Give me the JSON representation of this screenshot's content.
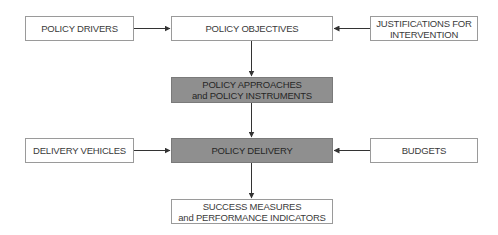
{
  "diagram": {
    "nodes": {
      "policy_drivers": {
        "label": "POLICY DRIVERS",
        "shaded": false
      },
      "policy_objectives": {
        "label": "POLICY OBJECTIVES",
        "shaded": false
      },
      "justifications": {
        "label": "JUSTIFICATIONS FOR\nINTERVENTION",
        "shaded": false
      },
      "policy_approaches": {
        "label": "POLICY APPROACHES\nand POLICY INSTRUMENTS",
        "shaded": true
      },
      "delivery_vehicles": {
        "label": "DELIVERY VEHICLES",
        "shaded": false
      },
      "policy_delivery": {
        "label": "POLICY DELIVERY",
        "shaded": true
      },
      "budgets": {
        "label": "BUDGETS",
        "shaded": false
      },
      "success_measures": {
        "label": "SUCCESS MEASURES\nand PERFORMANCE INDICATORS",
        "shaded": false
      }
    },
    "edges": [
      {
        "from": "policy_drivers",
        "to": "policy_objectives"
      },
      {
        "from": "justifications",
        "to": "policy_objectives"
      },
      {
        "from": "policy_objectives",
        "to": "policy_approaches"
      },
      {
        "from": "policy_approaches",
        "to": "policy_delivery"
      },
      {
        "from": "delivery_vehicles",
        "to": "policy_delivery"
      },
      {
        "from": "budgets",
        "to": "policy_delivery"
      },
      {
        "from": "policy_delivery",
        "to": "success_measures"
      }
    ],
    "colors": {
      "shaded_fill": "#8f8f8f",
      "border": "#9a9a9a",
      "arrow": "#333333",
      "text": "#3a3a3a"
    }
  }
}
